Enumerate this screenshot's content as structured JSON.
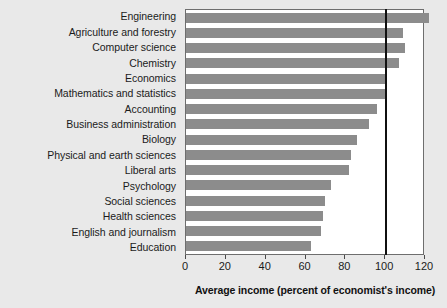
{
  "chart_data": {
    "type": "bar",
    "orientation": "horizontal",
    "title": "",
    "xlabel": "Average income (percent of economist's income)",
    "ylabel": "",
    "xlim": [
      0,
      120
    ],
    "xticks": [
      0,
      20,
      40,
      60,
      80,
      100,
      120
    ],
    "xtick_labels": [
      "0",
      "20",
      "40",
      "60",
      "80",
      "100",
      "120"
    ],
    "grid": false,
    "legend": null,
    "reference_line": {
      "value": 100,
      "label": "",
      "color": "#101010"
    },
    "bar_color": "#8c8c8c",
    "categories": [
      "Engineering",
      "Agriculture and forestry",
      "Computer science",
      "Chemistry",
      "Economics",
      "Mathematics and statistics",
      "Accounting",
      "Business administration",
      "Biology",
      "Physical and earth sciences",
      "Liberal arts",
      "Psychology",
      "Social sciences",
      "Health sciences",
      "English and journalism",
      "Education"
    ],
    "values": [
      122,
      109,
      110,
      107,
      100,
      100,
      96,
      92,
      86,
      83,
      82,
      73,
      70,
      69,
      68,
      63
    ]
  },
  "axis": {
    "x_title": "Average income (percent of economist's income)"
  }
}
